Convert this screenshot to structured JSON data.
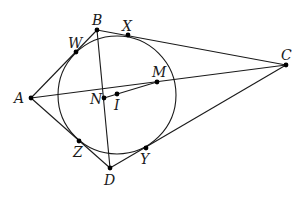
{
  "figure": {
    "type": "geometry",
    "colors": {
      "stroke": "#1a1a1a",
      "point": "#000000",
      "background": "#ffffff"
    },
    "circle": {
      "cx": 117,
      "cy": 95,
      "r": 59
    },
    "points": {
      "A": {
        "label": "A",
        "x": 31,
        "y": 98
      },
      "B": {
        "label": "B",
        "x": 97,
        "y": 30
      },
      "C": {
        "label": "C",
        "x": 286,
        "y": 65
      },
      "D": {
        "label": "D",
        "x": 110,
        "y": 168
      },
      "W": {
        "label": "W",
        "x": 76,
        "y": 52
      },
      "X": {
        "label": "X",
        "x": 128,
        "y": 35
      },
      "Y": {
        "label": "Y",
        "x": 146,
        "y": 148
      },
      "Z": {
        "label": "Z",
        "x": 79,
        "y": 141
      },
      "M": {
        "label": "M",
        "x": 157,
        "y": 82
      },
      "N": {
        "label": "N",
        "x": 104,
        "y": 98
      },
      "I": {
        "label": "I",
        "x": 117,
        "y": 94
      }
    },
    "segments": [
      [
        "A",
        "B"
      ],
      [
        "B",
        "C"
      ],
      [
        "C",
        "D"
      ],
      [
        "D",
        "A"
      ],
      [
        "B",
        "D"
      ],
      [
        "A",
        "C"
      ],
      [
        "N",
        "M"
      ]
    ]
  }
}
